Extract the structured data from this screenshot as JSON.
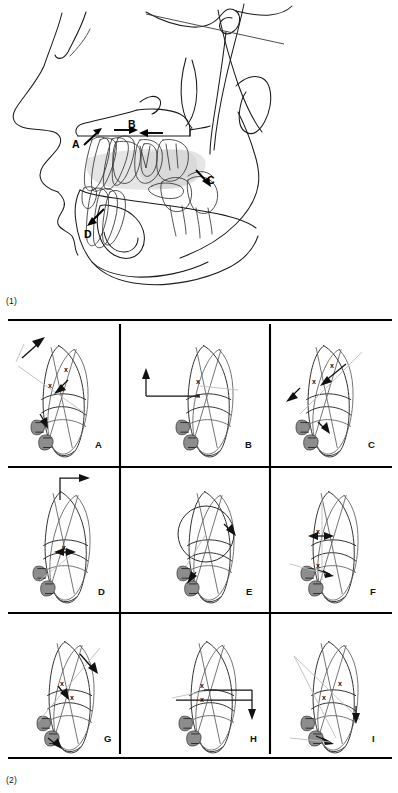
{
  "figure": {
    "domain_kind": "scientific-figure",
    "captions": [
      {
        "id": "caption-1",
        "text": "(1)"
      },
      {
        "id": "caption-2",
        "text": "(2)"
      }
    ]
  },
  "panel_1": {
    "name": "lateral-cephalometric-tracing",
    "description": "Lateral cephalometric tracing of skull, maxilla and mandible with superimposed dentition and four labelled movement arrows",
    "labels": [
      {
        "id": "A",
        "text": "A",
        "x": 76,
        "y": 143,
        "arrow": "up-right",
        "note": "maxillary incisor region"
      },
      {
        "id": "B",
        "text": "B",
        "x": 133,
        "y": 125,
        "arrow": "horizontal-converging",
        "note": "occlusal plane / incisor overjet"
      },
      {
        "id": "C",
        "text": "C",
        "x": 212,
        "y": 182,
        "arrow": "down-right",
        "note": "posterior maxillary dentition"
      },
      {
        "id": "D",
        "text": "D",
        "x": 89,
        "y": 235,
        "arrow": "down-left",
        "note": "mandibular incisor region"
      }
    ]
  },
  "panel_2": {
    "name": "tooth-movement-grid",
    "description": "Three by three grid of superimposed tooth tracings illustrating nine tooth movement types",
    "rows": 3,
    "columns": 3,
    "cells": [
      {
        "id": "A",
        "letter": "A",
        "row": 0,
        "col": 0,
        "movement": "oblique-up-right-extrusion"
      },
      {
        "id": "B",
        "letter": "B",
        "row": 0,
        "col": 1,
        "movement": "vertical-up-with-horizontal-offset"
      },
      {
        "id": "C",
        "letter": "C",
        "row": 0,
        "col": 2,
        "movement": "oblique-up-right-tipping"
      },
      {
        "id": "D",
        "letter": "D",
        "row": 1,
        "col": 0,
        "movement": "horizontal-right-translation"
      },
      {
        "id": "E",
        "letter": "E",
        "row": 1,
        "col": 1,
        "movement": "rotation-about-center"
      },
      {
        "id": "F",
        "letter": "F",
        "row": 1,
        "col": 2,
        "movement": "uprighting-root-movement"
      },
      {
        "id": "G",
        "letter": "G",
        "row": 2,
        "col": 0,
        "movement": "oblique-down-right-intrusion"
      },
      {
        "id": "H",
        "letter": "H",
        "row": 2,
        "col": 1,
        "movement": "vertical-down-intrusion"
      },
      {
        "id": "I",
        "letter": "I",
        "row": 2,
        "col": 2,
        "movement": "combined-tipping-translation"
      }
    ],
    "grid_geometry": {
      "vertical_dividers_x": [
        120,
        270
      ],
      "horizontal_dividers_y": [
        149,
        295
      ],
      "top_rule_y": 0,
      "bottom_rule_y": 440
    }
  },
  "colors": {
    "ink": "#1a1a1a",
    "grid": "#000000",
    "shade": "#cfcfcf",
    "bracket": "#8d8d8d",
    "faint": "#bdbdbd",
    "background": "#ffffff"
  }
}
